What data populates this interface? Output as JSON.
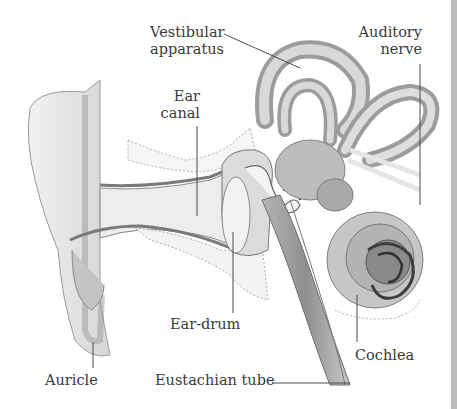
{
  "diagram": {
    "labels": {
      "vestibular_line1": "Vestibular",
      "vestibular_line2": "apparatus",
      "auditory_line1": "Auditory",
      "auditory_line2": "nerve",
      "ear_canal_line1": "Ear",
      "ear_canal_line2": "canal",
      "ear_drum": "Ear-drum",
      "cochlea": "Cochlea",
      "auricle": "Auricle",
      "eustachian_tube": "Eustachian tube"
    },
    "colors": {
      "tissue_light": "#e6e6e6",
      "tissue_mid": "#c9c9c9",
      "tissue_dark": "#a8a8a8",
      "outline": "#6e6e6e",
      "leader_line": "#4a4a4a",
      "text": "#3a3a3a",
      "side_bar": "#bdbdbd"
    }
  }
}
